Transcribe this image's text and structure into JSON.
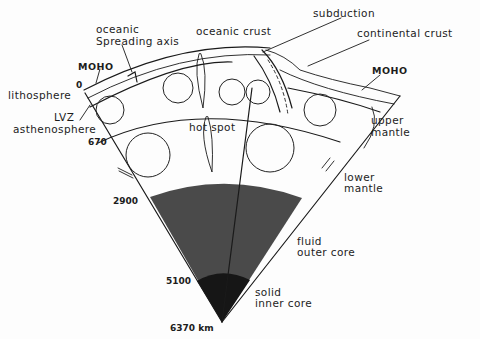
{
  "diagram": {
    "labels": {
      "oceanic_spreading_axis": [
        "oceanic",
        "Spreading axis"
      ],
      "oceanic_crust": "oceanic crust",
      "subduction": "subduction",
      "continental_crust": "continental crust",
      "moho_left": "MOHO",
      "moho_right": "MOHO",
      "lithosphere": "lithosphere",
      "lvz": "LVZ",
      "asthenosphere": "asthenosphere",
      "hot_spot": "hot spot",
      "upper_mantle": [
        "upper",
        "mantle"
      ],
      "lower_mantle": [
        "lower",
        "mantle"
      ],
      "fluid_outer_core": [
        "fluid",
        "outer core"
      ],
      "solid_inner_core": [
        "solid",
        "inner core"
      ]
    },
    "depths": {
      "surface": "0",
      "upper_lower_mantle": "670",
      "core_mantle_boundary": "2900",
      "inner_outer_core": "5100",
      "center": "6370 km"
    },
    "colors": {
      "outer_core": "#4a4a4a",
      "inner_core": "#161616",
      "ink": "#1a1a1a",
      "paper": "#fdfdfd"
    }
  }
}
